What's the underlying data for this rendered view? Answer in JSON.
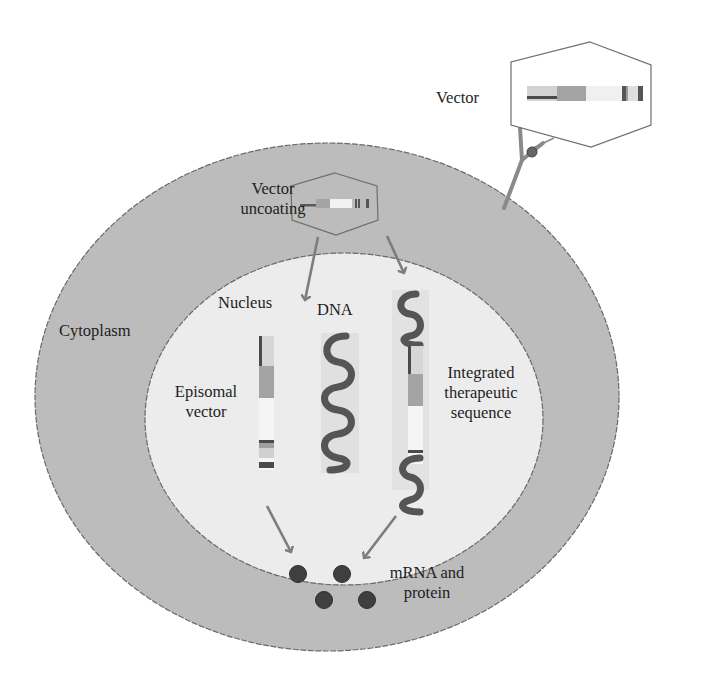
{
  "figure": {
    "colors": {
      "background": "#ffffff",
      "cytoplasm": "#bcbcbc",
      "nucleus": "#ececec",
      "membrane_stroke": "#6a6a6a",
      "arrow": "#7d7d7d",
      "dna_strand": "#4a4a4a",
      "protein_dot": "#3f3f3f",
      "hexagon_stroke": "#6e6e6e"
    }
  },
  "labels": {
    "vector": "Vector",
    "vector_uncoating_line1": "Vector",
    "vector_uncoating_line2": "uncoating",
    "nucleus": "Nucleus",
    "dna": "DNA",
    "cytoplasm": "Cytoplasm",
    "episomal_line1": "Episomal",
    "episomal_line2": "vector",
    "integrated_line1": "Integrated",
    "integrated_line2": "therapeutic",
    "integrated_line3": "sequence",
    "mrna_line1": "mRNA and",
    "mrna_line2": "protein"
  },
  "components": {
    "cell": "Cell with cytoplasm",
    "nucleus": "Nucleus",
    "receptor": "Cell-surface receptor",
    "ligand": "Vector ligand",
    "vector_particle": "Vector (hexagonal capsid with gene cassette)",
    "uncoating_particle": "Vector uncoating (capsid with cassette)",
    "episomal_vector": "Episomal vector (vertical cassette)",
    "genomic_dna": "Host genomic DNA (coiled)",
    "integrated_sequence": "Integrated therapeutic sequence within DNA",
    "products": "mRNA and protein (4 dots)"
  },
  "flow": [
    {
      "from": "vector",
      "to": "receptor",
      "label": "binding"
    },
    {
      "from": "uncoating",
      "to": "episomal_vector"
    },
    {
      "from": "uncoating",
      "to": "integrated_sequence"
    },
    {
      "from": "episomal_vector",
      "to": "mrna_and_protein"
    },
    {
      "from": "integrated_sequence",
      "to": "mrna_and_protein"
    }
  ]
}
